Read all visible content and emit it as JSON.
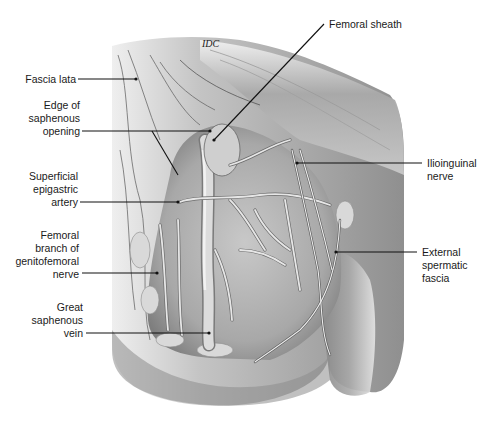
{
  "figure": {
    "signature": "IDC",
    "background_color": "#ffffff",
    "line_color": "#111111",
    "label_color": "#1a1a1a"
  },
  "labels": [
    {
      "id": "fascia-lata",
      "text": "Fascia lata",
      "side": "left",
      "x": 20,
      "y": 72,
      "w": 56,
      "line": [
        78,
        79,
        136,
        79
      ]
    },
    {
      "id": "edge-saphenous-opening",
      "text": "Edge of\nsaphenous\nopening",
      "side": "left",
      "x": 20,
      "y": 105,
      "w": 60,
      "line": [
        82,
        131,
        210,
        131
      ],
      "line2": [
        152,
        131,
        178,
        175
      ]
    },
    {
      "id": "femoral-sheath",
      "text": "Femoral sheath",
      "side": "right",
      "x": 328,
      "y": 18,
      "w": 100,
      "line": [
        324,
        24,
        214,
        140
      ]
    },
    {
      "id": "ilioinguinal-nerve",
      "text": "Ilioinguinal\nnerve",
      "side": "right",
      "x": 427,
      "y": 157,
      "w": 60,
      "line": [
        422,
        163,
        297,
        163
      ]
    },
    {
      "id": "superficial-epigastric-artery",
      "text": "Superficial\nepigastric\nartery",
      "side": "left",
      "x": 20,
      "y": 171,
      "w": 57,
      "line": [
        80,
        202,
        178,
        202
      ]
    },
    {
      "id": "femoral-branch-genitofemoral-nerve",
      "text": "Femoral\nbranch of\ngenitofemoral\nnerve",
      "side": "left",
      "x": 10,
      "y": 232,
      "w": 69,
      "line": [
        82,
        273,
        157,
        273
      ]
    },
    {
      "id": "external-spermatic-fascia",
      "text": "External\nspermatic\nfascia",
      "side": "right",
      "x": 422,
      "y": 247,
      "w": 60,
      "line": [
        417,
        252,
        336,
        252
      ]
    },
    {
      "id": "great-saphenous-vein",
      "text": "Great\nsaphenous\nvein",
      "side": "left",
      "x": 20,
      "y": 303,
      "w": 63,
      "line": [
        86,
        333,
        209,
        333
      ]
    }
  ]
}
